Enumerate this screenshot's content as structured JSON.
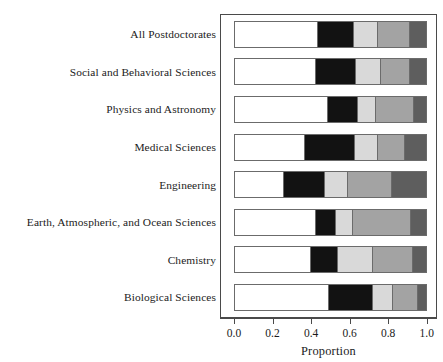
{
  "chart_data": {
    "type": "bar",
    "orientation": "horizontal",
    "stacked": true,
    "normalized": true,
    "title": "",
    "xlabel": "Proportion",
    "ylabel": "",
    "xlim": [
      0.0,
      1.0
    ],
    "grid": false,
    "legend": "none",
    "xticks": [
      "0.0",
      "0.2",
      "0.4",
      "0.6",
      "0.8",
      "1.0"
    ],
    "xtick_values": [
      0.0,
      0.2,
      0.4,
      0.6,
      0.8,
      1.0
    ],
    "categories": [
      "All Postdoctorates",
      "Social and Behavioral Sciences",
      "Physics and Astronomy",
      "Medical Sciences",
      "Engineering",
      "Earth, Atmospheric, and Ocean Sciences",
      "Chemistry",
      "Biological Sciences"
    ],
    "segment_colors": [
      "#ffffff",
      "#121212",
      "#d9d9d9",
      "#a3a3a3",
      "#5e5e5e"
    ],
    "series": [
      {
        "name": "Segment 1",
        "color": "#ffffff",
        "values": [
          0.432,
          0.422,
          0.481,
          0.363,
          0.256,
          0.42,
          0.394,
          0.49
        ]
      },
      {
        "name": "Segment 2",
        "color": "#121212",
        "values": [
          0.184,
          0.204,
          0.156,
          0.26,
          0.211,
          0.104,
          0.139,
          0.225
        ]
      },
      {
        "name": "Segment 3",
        "color": "#d9d9d9",
        "values": [
          0.124,
          0.132,
          0.095,
          0.118,
          0.118,
          0.087,
          0.181,
          0.104
        ]
      },
      {
        "name": "Segment 4",
        "color": "#a3a3a3",
        "values": [
          0.17,
          0.15,
          0.198,
          0.141,
          0.228,
          0.302,
          0.208,
          0.133
        ]
      },
      {
        "name": "Segment 5",
        "color": "#5e5e5e",
        "values": [
          0.09,
          0.092,
          0.07,
          0.118,
          0.187,
          0.087,
          0.078,
          0.048
        ]
      }
    ],
    "cumulative_boundaries": [
      [
        0.432,
        0.616,
        0.74,
        0.91,
        1.0
      ],
      [
        0.422,
        0.626,
        0.758,
        0.908,
        1.0
      ],
      [
        0.481,
        0.637,
        0.732,
        0.93,
        1.0
      ],
      [
        0.363,
        0.623,
        0.741,
        0.882,
        1.0
      ],
      [
        0.256,
        0.467,
        0.585,
        0.813,
        1.0
      ],
      [
        0.42,
        0.524,
        0.611,
        0.913,
        1.0
      ],
      [
        0.394,
        0.533,
        0.714,
        0.922,
        1.0
      ],
      [
        0.49,
        0.715,
        0.819,
        0.952,
        1.0
      ]
    ]
  }
}
